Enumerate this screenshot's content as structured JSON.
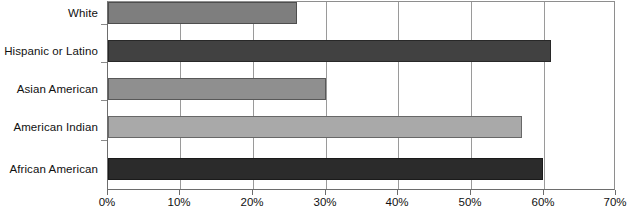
{
  "chart_data": {
    "type": "bar",
    "orientation": "horizontal",
    "title": "",
    "xlabel": "",
    "ylabel": "",
    "categories": [
      "African American",
      "American Indian",
      "Asian American",
      "Hispanic or Latino",
      "White"
    ],
    "values": [
      60,
      57,
      30,
      61,
      26
    ],
    "value_suffix": "%",
    "xlim": [
      0,
      70
    ],
    "xticks": [
      0,
      10,
      20,
      30,
      40,
      50,
      60,
      70
    ],
    "xtick_labels": [
      "0%",
      "10%",
      "20%",
      "30%",
      "40%",
      "50%",
      "60%",
      "70%"
    ],
    "grid": true,
    "grid_axis": "x",
    "legend": "none",
    "series": [
      {
        "name": "percentage",
        "values": [
          60,
          57,
          30,
          61,
          26
        ]
      }
    ],
    "bar_colors": [
      "#2b2b2b",
      "#a9a9a9",
      "#8f8f8f",
      "#414141",
      "#7e7e7e"
    ],
    "bars": [
      {
        "label": "White",
        "value": 26,
        "color": "#7e7e7e"
      },
      {
        "label": "Hispanic or Latino",
        "value": 61,
        "color": "#414141"
      },
      {
        "label": "Asian American",
        "value": 30,
        "color": "#8f8f8f"
      },
      {
        "label": "American Indian",
        "value": 57,
        "color": "#a9a9a9"
      },
      {
        "label": "African American",
        "value": 60,
        "color": "#2b2b2b"
      }
    ]
  },
  "axis": {
    "tick_labels": [
      "0%",
      "10%",
      "20%",
      "30%",
      "40%",
      "50%",
      "60%",
      "70%"
    ]
  },
  "colors": {
    "axis_line": "#6d6d6d",
    "gridline": "#9a9a9a",
    "text": "#111111",
    "background": "#ffffff"
  }
}
